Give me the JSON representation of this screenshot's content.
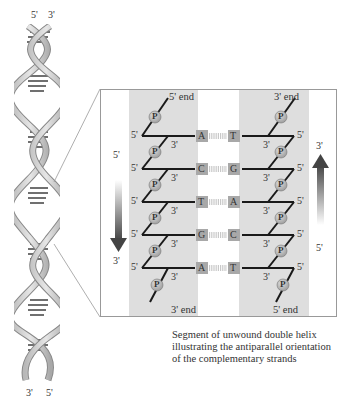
{
  "helix": {
    "top_labels": [
      "5'",
      "3'"
    ],
    "bottom_labels": [
      "3'",
      "5'"
    ]
  },
  "panel": {
    "left_strand": {
      "top_end": "5' end",
      "bottom_end": "3' end",
      "direction": {
        "from": "5'",
        "to": "3'",
        "arrow": "down"
      },
      "phosphate_label": "P",
      "row_left_label": "5'",
      "row_right_label": "3'"
    },
    "right_strand": {
      "top_end": "3' end",
      "bottom_end": "5' end",
      "direction": {
        "from": "5'",
        "to": "3'",
        "arrow": "up"
      },
      "phosphate_label": "P",
      "row_left_label": "3'",
      "row_right_label": "5'"
    },
    "base_pairs": [
      {
        "left": "A",
        "right": "T"
      },
      {
        "left": "C",
        "right": "G"
      },
      {
        "left": "T",
        "right": "A"
      },
      {
        "left": "G",
        "right": "C"
      },
      {
        "left": "A",
        "right": "T"
      }
    ]
  },
  "caption": {
    "lines": [
      "Segment of unwound double helix",
      "illustrating the antiparallel orientation",
      "of the complementary strands"
    ]
  },
  "colors": {
    "shade": "#dcdcdc",
    "base_box": "#a8a8a8",
    "phosphate": "#b0b0b0",
    "line": "#222222",
    "arrow_dark": "#444444",
    "frame": "#999999"
  }
}
